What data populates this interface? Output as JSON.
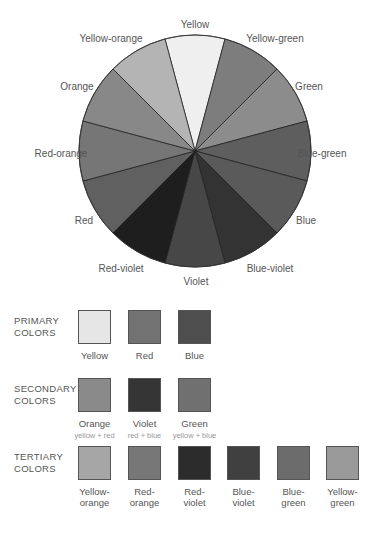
{
  "wheel": {
    "center": [
      195,
      151
    ],
    "radius": 116,
    "segments": [
      {
        "name": "Yellow",
        "color": "#efefef",
        "label_pos": [
          195,
          24
        ]
      },
      {
        "name": "Yellow-green",
        "color": "#7d7d7d",
        "label_pos": [
          275,
          38
        ]
      },
      {
        "name": "Green",
        "color": "#8c8c8c",
        "label_pos": [
          309,
          86
        ]
      },
      {
        "name": "Blue-green",
        "color": "#5e5e5e",
        "label_pos": [
          322,
          153
        ]
      },
      {
        "name": "Blue",
        "color": "#5a5a5a",
        "label_pos": [
          306,
          220
        ]
      },
      {
        "name": "Blue-violet",
        "color": "#333333",
        "label_pos": [
          270,
          268
        ]
      },
      {
        "name": "Violet",
        "color": "#474747",
        "label_pos": [
          196,
          281
        ]
      },
      {
        "name": "Red-violet",
        "color": "#1e1e1e",
        "label_pos": [
          121,
          268
        ]
      },
      {
        "name": "Red",
        "color": "#606060",
        "label_pos": [
          84,
          220
        ]
      },
      {
        "name": "Red-orange",
        "color": "#767676",
        "label_pos": [
          61,
          153
        ]
      },
      {
        "name": "Orange",
        "color": "#888888",
        "label_pos": [
          77,
          86
        ]
      },
      {
        "name": "Yellow-orange",
        "color": "#b4b4b4",
        "label_pos": [
          111,
          38
        ]
      }
    ]
  },
  "groups": [
    {
      "title_line1": "PRIMARY",
      "title_line2": "COLORS",
      "top": 310,
      "swatches": [
        {
          "name": "Yellow",
          "color": "#e6e6e6",
          "line1": "Yellow",
          "line2": "",
          "sub": ""
        },
        {
          "name": "Red",
          "color": "#727272",
          "line1": "Red",
          "line2": "",
          "sub": ""
        },
        {
          "name": "Blue",
          "color": "#4e4e4e",
          "line1": "Blue",
          "line2": "",
          "sub": ""
        }
      ]
    },
    {
      "title_line1": "SECONDARY",
      "title_line2": "COLORS",
      "top": 378,
      "swatches": [
        {
          "name": "Orange",
          "color": "#8a8a8a",
          "line1": "Orange",
          "line2": "",
          "sub": "yellow + red"
        },
        {
          "name": "Violet",
          "color": "#353535",
          "line1": "Violet",
          "line2": "",
          "sub": "red + blue"
        },
        {
          "name": "Green",
          "color": "#707070",
          "line1": "Green",
          "line2": "",
          "sub": "yellow + blue"
        }
      ]
    },
    {
      "title_line1": "TERTIARY",
      "title_line2": "COLORS",
      "top": 446,
      "swatches": [
        {
          "name": "Yellow-orange",
          "color": "#a6a6a6",
          "line1": "Yellow-",
          "line2": "orange",
          "sub": ""
        },
        {
          "name": "Red-orange",
          "color": "#777777",
          "line1": "Red-",
          "line2": "orange",
          "sub": ""
        },
        {
          "name": "Red-violet",
          "color": "#2c2c2c",
          "line1": "Red-",
          "line2": "violet",
          "sub": ""
        },
        {
          "name": "Blue-violet",
          "color": "#404040",
          "line1": "Blue-",
          "line2": "violet",
          "sub": ""
        },
        {
          "name": "Blue-green",
          "color": "#6c6c6c",
          "line1": "Blue-",
          "line2": "green",
          "sub": ""
        },
        {
          "name": "Yellow-green",
          "color": "#9a9a9a",
          "line1": "Yellow-",
          "line2": "green",
          "sub": ""
        }
      ]
    }
  ],
  "swatch_x": [
    78,
    128,
    178,
    227,
    277,
    326
  ]
}
